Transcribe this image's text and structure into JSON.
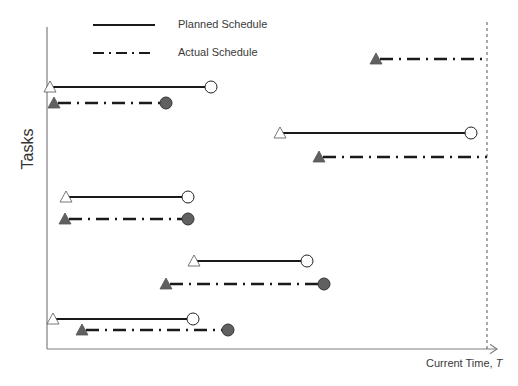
{
  "legend": {
    "planned_label": "Planned Schedule",
    "actual_label": "Actual Schedule"
  },
  "axes": {
    "ylabel": "Tasks",
    "xlabel_prefix": "Current Time, ",
    "xlabel_var": "T"
  },
  "colors": {
    "axis": "#7f7f7f",
    "line": "#1a1a1a",
    "actual_marker": "#606060",
    "planned_marker_fill": "#ffffff"
  },
  "current_time_x": 487,
  "tasks": [
    {
      "name": "Task 1",
      "planned": {
        "start": 50,
        "end": 211,
        "y": 87
      },
      "actual": {
        "start": 54,
        "end": 166,
        "y": 103,
        "finished": true
      }
    },
    {
      "name": "Task 2",
      "planned": {
        "start": 280,
        "end": 471,
        "y": 133
      },
      "actual": {
        "start": 319,
        "end": 487,
        "y": 157,
        "finished": false
      }
    },
    {
      "name": "Task 3",
      "planned": {
        "start": 66,
        "end": 188,
        "y": 197
      },
      "actual": {
        "start": 65,
        "end": 188,
        "y": 219,
        "finished": true
      }
    },
    {
      "name": "Task 4",
      "planned": {
        "start": 194,
        "end": 307,
        "y": 261
      },
      "actual": {
        "start": 166,
        "end": 324,
        "y": 284,
        "finished": true
      }
    },
    {
      "name": "Task 5",
      "planned": {
        "start": 53,
        "end": 193,
        "y": 319
      },
      "actual": {
        "start": 82,
        "end": 228,
        "y": 330,
        "finished": true
      }
    },
    {
      "name": "Task 6",
      "planned": null,
      "actual": {
        "start": 376,
        "end": 487,
        "y": 59,
        "finished": false
      }
    }
  ]
}
